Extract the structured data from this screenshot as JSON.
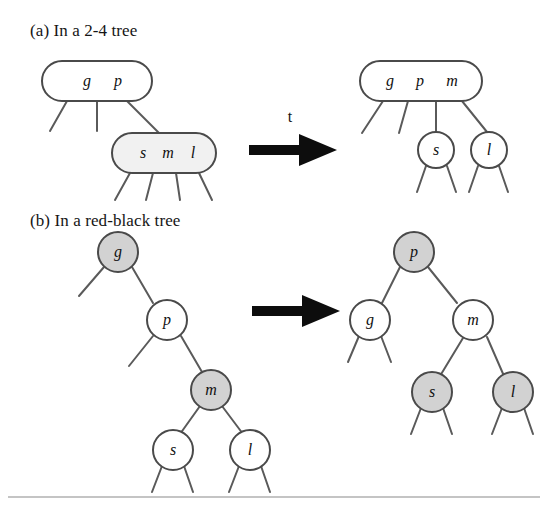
{
  "figure": {
    "background_color": "#ffffff",
    "ink_color": "#4a4a4a",
    "fill_white": "#ffffff",
    "fill_shaded_light": "#f1f1f1",
    "fill_shaded_gray": "#d2d2d2",
    "arrow_color": "#0d0d0d",
    "rule_color": "#8a8a8a"
  },
  "panels": [
    {
      "id": "panel-a",
      "caption": "(a) In a 2-4 tree",
      "arrow_label": "t",
      "before": {
        "nodes": [
          {
            "id": "a-before-root",
            "shape": "rounded-rect",
            "keys": "g p",
            "key_list": [
              "g",
              "p"
            ],
            "fill": "white",
            "children": 3
          },
          {
            "id": "a-before-child",
            "shape": "rounded-rect",
            "keys": "s m l",
            "key_list": [
              "s",
              "m",
              "l"
            ],
            "fill": "light",
            "children": 4
          }
        ]
      },
      "after": {
        "nodes": [
          {
            "id": "a-after-root",
            "shape": "rounded-rect",
            "keys": "g p m",
            "key_list": [
              "g",
              "p",
              "m"
            ],
            "fill": "white",
            "children": 4
          },
          {
            "id": "a-after-s",
            "shape": "circle",
            "keys": "s",
            "key_list": [
              "s"
            ],
            "fill": "white",
            "children": 2
          },
          {
            "id": "a-after-l",
            "shape": "circle",
            "keys": "l",
            "key_list": [
              "l"
            ],
            "fill": "white",
            "children": 2
          }
        ]
      }
    },
    {
      "id": "panel-b",
      "caption": "(b) In a red-black tree",
      "arrow_label": "",
      "before": {
        "nodes": [
          {
            "id": "b-before-g",
            "shape": "circle",
            "keys": "g",
            "key_list": [
              "g"
            ],
            "fill": "gray",
            "children": 1
          },
          {
            "id": "b-before-p",
            "shape": "circle",
            "keys": "p",
            "key_list": [
              "p"
            ],
            "fill": "white",
            "children": 1
          },
          {
            "id": "b-before-m",
            "shape": "circle",
            "keys": "m",
            "key_list": [
              "m"
            ],
            "fill": "gray",
            "children": 2
          },
          {
            "id": "b-before-s",
            "shape": "circle",
            "keys": "s",
            "key_list": [
              "s"
            ],
            "fill": "white",
            "children": 2
          },
          {
            "id": "b-before-l",
            "shape": "circle",
            "keys": "l",
            "key_list": [
              "l"
            ],
            "fill": "white",
            "children": 2
          }
        ]
      },
      "after": {
        "nodes": [
          {
            "id": "b-after-p",
            "shape": "circle",
            "keys": "p",
            "key_list": [
              "p"
            ],
            "fill": "gray",
            "children": 2
          },
          {
            "id": "b-after-g",
            "shape": "circle",
            "keys": "g",
            "key_list": [
              "g"
            ],
            "fill": "white",
            "children": 2
          },
          {
            "id": "b-after-m",
            "shape": "circle",
            "keys": "m",
            "key_list": [
              "m"
            ],
            "fill": "white",
            "children": 2
          },
          {
            "id": "b-after-s",
            "shape": "circle",
            "keys": "s",
            "key_list": [
              "s"
            ],
            "fill": "gray",
            "children": 2
          },
          {
            "id": "b-after-l",
            "shape": "circle",
            "keys": "l",
            "key_list": [
              "l"
            ],
            "fill": "gray",
            "children": 2
          }
        ]
      }
    }
  ],
  "labels": {
    "caption_a": "(a) In a 2-4 tree",
    "caption_b": "(b) In a red-black tree",
    "arrow_t": "t",
    "a_before_root_k1": "g",
    "a_before_root_k2": "p",
    "a_before_child_k1": "s",
    "a_before_child_k2": "m",
    "a_before_child_k3": "l",
    "a_after_root_k1": "g",
    "a_after_root_k2": "p",
    "a_after_root_k3": "m",
    "a_after_s": "s",
    "a_after_l": "l",
    "b_before_g": "g",
    "b_before_p": "p",
    "b_before_m": "m",
    "b_before_s": "s",
    "b_before_l": "l",
    "b_after_p": "p",
    "b_after_g": "g",
    "b_after_m": "m",
    "b_after_s": "s",
    "b_after_l": "l"
  }
}
